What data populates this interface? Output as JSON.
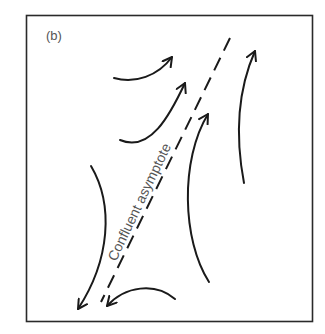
{
  "figure": {
    "panel_label": "(b)",
    "asymptote_label": "Confluent asymptote",
    "stroke_color": "#1a1a1a",
    "label_color": "#555555",
    "background": "#ffffff"
  },
  "arrows": [
    {
      "name": "upper-left-arrow",
      "direction": "up-right"
    },
    {
      "name": "middle-left-arrow",
      "direction": "up-right"
    },
    {
      "name": "center-right-arrow",
      "direction": "up"
    },
    {
      "name": "far-right-arrow",
      "direction": "up"
    },
    {
      "name": "lower-left-arrow",
      "direction": "down-left"
    },
    {
      "name": "bottom-arrow",
      "direction": "left"
    }
  ]
}
